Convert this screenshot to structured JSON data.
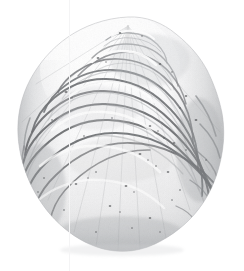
{
  "image": {
    "subject": "oyster-shell",
    "subject_label": "Oyster shell (bivalve) left valve, exterior view",
    "description": "Single bivalve mollusc shell photographed against a plain white background, oriented with the umbo (beak) at top and the ventral margin at bottom. The exterior surface shows numerous concentric growth lamellae forming ruffled, overlapping foliated layers. Surface is chalky white to pale grey with darker grey shadow lines between lamellae and scattered small dark pits and borings.",
    "view": "exterior / dorsal-ventral",
    "orientation": "umbo at top, ventral margin at bottom",
    "background": "plain white studio background",
    "lighting": "diffuse, light from upper left",
    "medium": "scanned photographic plate",
    "width_px": 244,
    "height_px": 271
  },
  "colors": {
    "background": "#ffffff",
    "shell_highlight": "#fdfdfd",
    "shell_light": "#f2f2f3",
    "shell_mid": "#d8d9da",
    "shell_shadow": "#b6b8ba",
    "shell_deep_shadow": "#8e9093",
    "lamella_line": "#6e7073",
    "pit_dark": "#4a4c4f",
    "outline": "#9a9c9f",
    "scan_line": "#f4f4f5"
  },
  "geometry": {
    "silhouette_left_px": 18,
    "silhouette_right_px": 224,
    "silhouette_top_px": 16,
    "silhouette_bottom_px": 252,
    "umbo_x_px": 128,
    "umbo_y_px": 20,
    "widest_y_px": 190,
    "scan_line_x_px": 69
  },
  "features": [
    {
      "name": "umbo",
      "label": "Umbo (beak)",
      "x": 128,
      "y": 24
    },
    {
      "name": "growth-lamellae",
      "label": "Concentric growth lamellae",
      "count_visible": 12
    },
    {
      "name": "ventral-margin",
      "label": "Ruffled ventral margin",
      "x": 120,
      "y": 245
    },
    {
      "name": "surface-pits",
      "label": "Scattered dark surface pits and borings",
      "count_visible": 40
    },
    {
      "name": "left-flank-shadow",
      "label": "Shaded left flank",
      "x": 40,
      "y": 180
    },
    {
      "name": "right-flank-ridges",
      "label": "Stepped ridges on right flank",
      "x": 195,
      "y": 150
    }
  ]
}
